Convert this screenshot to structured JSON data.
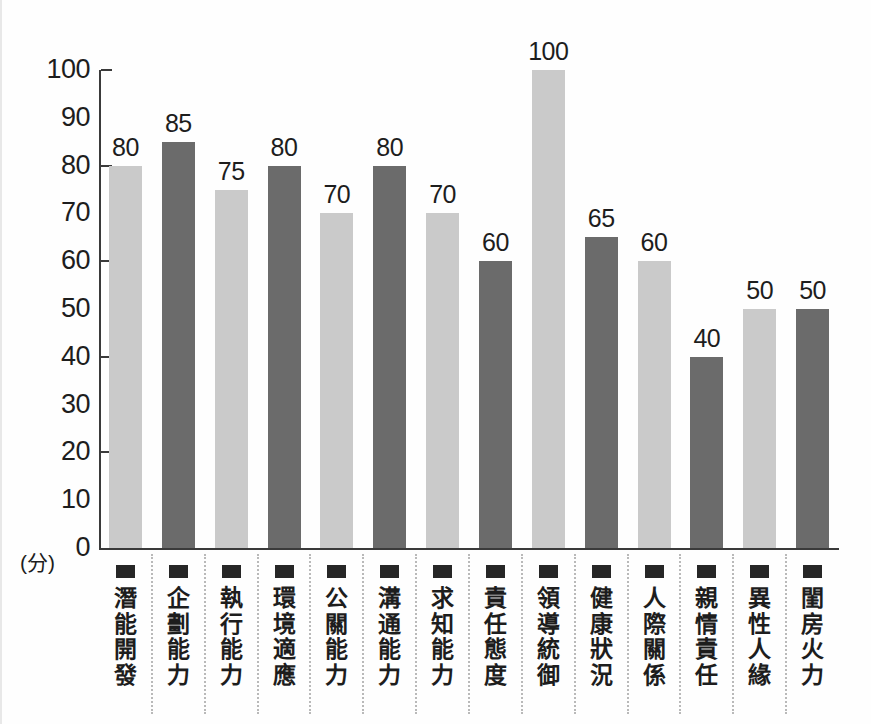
{
  "chart_data": {
    "type": "bar",
    "title": "",
    "xlabel": "",
    "ylabel": "(分)",
    "ylim": [
      0,
      100
    ],
    "ystep": 10,
    "ytick_labels": [
      "100",
      "90",
      "80",
      "70",
      "60",
      "50",
      "40",
      "30",
      "20",
      "10",
      "0"
    ],
    "major_ticks": [
      100,
      80,
      60,
      40,
      20
    ],
    "grid": false,
    "legend": "none",
    "categories": [
      "潛能開發",
      "企劃能力",
      "執行能力",
      "環境適應",
      "公關能力",
      "溝通能力",
      "求知能力",
      "責任態度",
      "領導統御",
      "健康狀況",
      "人際關係",
      "親情責任",
      "異性人緣",
      "閨房火力"
    ],
    "values": [
      80,
      85,
      75,
      80,
      70,
      80,
      70,
      60,
      100,
      65,
      60,
      40,
      50,
      50
    ],
    "bar_colors": [
      "#cacaca",
      "#6b6b6b",
      "#cacaca",
      "#6b6b6b",
      "#cacaca",
      "#6b6b6b",
      "#cacaca",
      "#6b6b6b",
      "#cacaca",
      "#6b6b6b",
      "#cacaca",
      "#6b6b6b",
      "#cacaca",
      "#6b6b6b"
    ],
    "palette": {
      "light": "#cacaca",
      "dark": "#6b6b6b",
      "axis": "#3a3a3a",
      "text": "#1d1d1d",
      "separator": "#b9b9b9",
      "marker": "#262626",
      "background": "#fefefe"
    }
  }
}
